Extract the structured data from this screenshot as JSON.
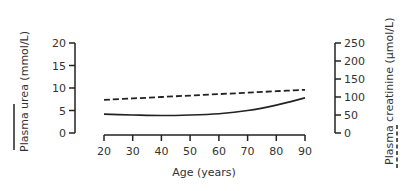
{
  "chart_data": {
    "type": "line",
    "title": "",
    "xlabel": "Age (years)",
    "ylabel": "Plasma urea (mmol/L)",
    "y2label": "Plasma creatinine (µmol/L)",
    "x_ticks": [
      20,
      30,
      40,
      50,
      60,
      70,
      80,
      90
    ],
    "y_ticks": [
      0,
      5,
      10,
      15,
      20
    ],
    "y2_ticks": [
      0,
      50,
      100,
      150,
      200,
      250
    ],
    "xlim": [
      20,
      90
    ],
    "ylim": [
      0,
      20
    ],
    "y2lim": [
      0,
      250
    ],
    "grid": false,
    "legend": "line-style keys under axis titles (solid = urea, dashed = creatinine)",
    "series": [
      {
        "name": "Plasma urea",
        "axis": "left",
        "style": "solid",
        "x": [
          20,
          30,
          40,
          50,
          60,
          70,
          80,
          90
        ],
        "values": [
          4.2,
          4.0,
          3.9,
          4.0,
          4.3,
          5.0,
          6.2,
          7.8
        ]
      },
      {
        "name": "Plasma creatinine",
        "axis": "right",
        "style": "dashed",
        "x": [
          20,
          30,
          40,
          50,
          60,
          70,
          80,
          90
        ],
        "values": [
          92,
          96,
          100,
          104,
          108,
          112,
          116,
          120
        ]
      }
    ]
  },
  "labels": {
    "xlabel": "Age (years)",
    "ylabel_left": "Plasma urea (mmol/L)",
    "ylabel_right": "Plasma creatinine (µmol/L)",
    "x_ticks": [
      "20",
      "30",
      "40",
      "50",
      "60",
      "70",
      "80",
      "90"
    ],
    "y_ticks_left": [
      "0",
      "5",
      "10",
      "15",
      "20"
    ],
    "y_ticks_right": [
      "0",
      "50",
      "100",
      "150",
      "200",
      "250"
    ]
  }
}
